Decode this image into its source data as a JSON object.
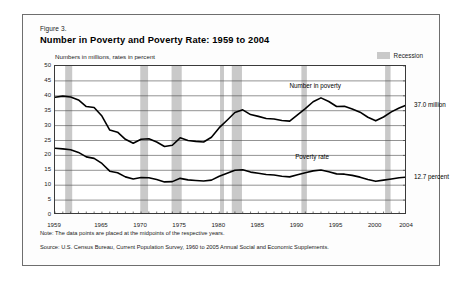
{
  "figure": {
    "number": "Figure 3.",
    "title": "Number in Poverty and Poverty Rate:  1959 to 2004",
    "axis_note": "Numbers in millions, rates in percent",
    "note": "Note:  The data points are placed at the midpoints of the respective years.",
    "source": "Source:  U.S. Census Bureau, Current Population Survey, 1960 to 2005 Annual Social and Economic Supplements."
  },
  "legend": {
    "recession_label": "Recession",
    "recession_color": "#c9c9c9"
  },
  "annotations": {
    "number_in_poverty": "Number in poverty",
    "poverty_rate": "Poverty rate",
    "end_number": "37.0 million",
    "end_rate": "12.7 percent"
  },
  "chart_data": {
    "type": "line",
    "title": "Number in Poverty and Poverty Rate:  1959 to 2004",
    "subtitle": "Numbers in millions, rates in percent",
    "xlabel": "",
    "ylabel": "",
    "xlim": [
      1959,
      2004
    ],
    "ylim": [
      0,
      50
    ],
    "ytick_step": 5,
    "yticks": [
      0,
      5,
      10,
      15,
      20,
      25,
      30,
      35,
      40,
      45,
      50
    ],
    "xticks_labeled": [
      1959,
      1965,
      1970,
      1975,
      1980,
      1985,
      1990,
      1995,
      2000,
      2004
    ],
    "xtick_minor_every": 1,
    "grid": "horizontal",
    "legend_position": "top-right",
    "line_color": "#000000",
    "x": [
      1959,
      1960,
      1961,
      1962,
      1963,
      1964,
      1965,
      1966,
      1967,
      1968,
      1969,
      1970,
      1971,
      1972,
      1973,
      1974,
      1975,
      1976,
      1977,
      1978,
      1979,
      1980,
      1981,
      1982,
      1983,
      1984,
      1985,
      1986,
      1987,
      1988,
      1989,
      1990,
      1991,
      1992,
      1993,
      1994,
      1995,
      1996,
      1997,
      1998,
      1999,
      2000,
      2001,
      2002,
      2003,
      2004
    ],
    "series": [
      {
        "name": "Number in poverty",
        "units": "millions",
        "end_label": "37.0 million",
        "values": [
          39.5,
          39.9,
          39.6,
          38.6,
          36.4,
          36.1,
          33.2,
          28.5,
          27.8,
          25.4,
          24.1,
          25.4,
          25.6,
          24.5,
          23.0,
          23.4,
          25.9,
          25.0,
          24.7,
          24.5,
          26.1,
          29.3,
          31.8,
          34.4,
          35.3,
          33.7,
          33.1,
          32.4,
          32.2,
          31.7,
          31.5,
          33.6,
          35.7,
          38.0,
          39.3,
          38.1,
          36.4,
          36.5,
          35.6,
          34.5,
          32.8,
          31.6,
          32.9,
          34.6,
          35.9,
          37.0
        ]
      },
      {
        "name": "Poverty rate",
        "units": "percent",
        "end_label": "12.7 percent",
        "values": [
          22.4,
          22.2,
          21.9,
          21.0,
          19.5,
          19.0,
          17.3,
          14.7,
          14.2,
          12.8,
          12.1,
          12.6,
          12.5,
          11.9,
          11.1,
          11.2,
          12.3,
          11.8,
          11.6,
          11.4,
          11.7,
          13.0,
          14.0,
          15.0,
          15.2,
          14.4,
          14.0,
          13.6,
          13.4,
          13.0,
          12.8,
          13.5,
          14.2,
          14.8,
          15.1,
          14.5,
          13.8,
          13.7,
          13.3,
          12.7,
          11.9,
          11.3,
          11.7,
          12.1,
          12.5,
          12.7
        ]
      }
    ],
    "recession_bands": [
      {
        "start": 1960.3,
        "end": 1961.2
      },
      {
        "start": 1969.9,
        "end": 1970.9
      },
      {
        "start": 1973.9,
        "end": 1975.2
      },
      {
        "start": 1980.1,
        "end": 1980.6
      },
      {
        "start": 1981.6,
        "end": 1982.9
      },
      {
        "start": 1990.5,
        "end": 1991.2
      },
      {
        "start": 2001.2,
        "end": 2001.9
      }
    ]
  }
}
